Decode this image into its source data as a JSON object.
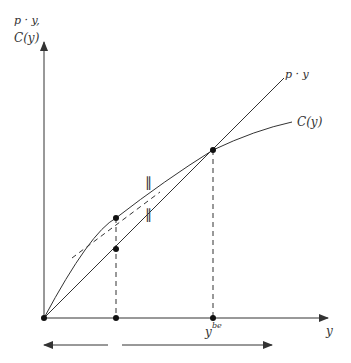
{
  "diagram": {
    "y_axis_label_line1": "p · y,",
    "y_axis_label_line2": "C(y)",
    "x_axis_label": "y",
    "revenue_curve_label": "p · y",
    "cost_curve_label": "C(y)",
    "breakeven_label": "y",
    "breakeven_superscript": "be",
    "parallel_marks": "∥",
    "colors": {
      "line": "#333333",
      "background": "#ffffff"
    }
  }
}
